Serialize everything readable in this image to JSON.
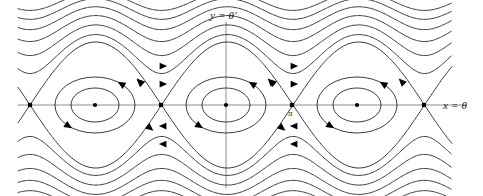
{
  "figure": {
    "title": "",
    "type": "phase-portrait",
    "background_color": "#ffffff",
    "curve_color": "#1a1a1a",
    "axis_color": "#808080",
    "labels": {
      "y_axis": {
        "text": "y = θ′",
        "lhs": "y",
        "eq": "=",
        "rhs": "θ′"
      },
      "x_axis": {
        "text": "x = θ",
        "lhs": "x",
        "eq": "=",
        "rhs": "θ"
      },
      "pi_tick": {
        "text": "π"
      }
    }
  },
  "chart_data": {
    "type": "line",
    "title": "",
    "xlabel": "x = θ",
    "ylabel": "y = θ′",
    "grid": false,
    "legend": null,
    "annotations": [
      {
        "text": "y = θ′",
        "position": "top-center",
        "px": [
          215,
          14
        ]
      },
      {
        "text": "x = θ",
        "position": "right-middle",
        "px": [
          448,
          105
        ]
      },
      {
        "text": "π",
        "position": "below-saddle",
        "px": [
          291,
          113
        ]
      }
    ],
    "axes": {
      "x_axis_y_px": 105,
      "y_axis_x_px": 226,
      "xlim_px": [
        18,
        452
      ],
      "ylim_px": [
        22,
        184
      ]
    },
    "fixed_points": {
      "saddles": [
        {
          "label": "-π",
          "px": [
            30,
            105
          ]
        },
        {
          "label": "0-left-boundary",
          "px": [
            161,
            105
          ]
        },
        {
          "label": "π",
          "px": [
            292,
            105
          ]
        },
        {
          "label": "2π",
          "px": [
            424,
            105
          ]
        }
      ],
      "centers": [
        {
          "label": "center-left",
          "px": [
            95,
            105
          ]
        },
        {
          "label": "center-middle",
          "px": [
            226,
            105
          ]
        },
        {
          "label": "center-right",
          "px": [
            357,
            105
          ]
        }
      ]
    },
    "period_px": 131.5,
    "libration_orbits": {
      "count_per_well": 2,
      "radii_px": [
        {
          "rx": 40,
          "ry": 28
        },
        {
          "rx": 24,
          "ry": 17
        }
      ],
      "direction": "clockwise"
    },
    "separatrix": {
      "amplitude_px": 62,
      "direction": "clockwise"
    },
    "rotation_orbits": {
      "above": {
        "count": 6,
        "direction": "right",
        "offsets_px": [
          10,
          22,
          33,
          43,
          52,
          60
        ]
      },
      "below": {
        "count": 6,
        "direction": "left",
        "offsets_px": [
          10,
          22,
          33,
          43,
          52,
          60
        ]
      }
    },
    "arrows": {
      "upper_rotation": [
        {
          "px": [
            163,
            66
          ],
          "dir": "right"
        },
        {
          "px": [
            163,
            84
          ],
          "dir": "right"
        },
        {
          "px": [
            294,
            66
          ],
          "dir": "right"
        },
        {
          "px": [
            294,
            84
          ],
          "dir": "right"
        }
      ],
      "lower_rotation": [
        {
          "px": [
            163,
            144
          ],
          "dir": "left"
        },
        {
          "px": [
            163,
            126
          ],
          "dir": "left"
        },
        {
          "px": [
            294,
            144
          ],
          "dir": "left"
        },
        {
          "px": [
            294,
            126
          ],
          "dir": "left"
        }
      ],
      "separatrix": [
        {
          "px": [
            140,
            82
          ],
          "dir": "up-left"
        },
        {
          "px": [
            150,
            128
          ],
          "dir": "down-right"
        },
        {
          "px": [
            272,
            82
          ],
          "dir": "up-left"
        },
        {
          "px": [
            282,
            128
          ],
          "dir": "down-right"
        }
      ],
      "libration": [
        {
          "px": [
            125,
            80
          ],
          "dir": "clockwise"
        },
        {
          "px": [
            256,
            80
          ],
          "dir": "clockwise"
        },
        {
          "px": [
            388,
            80
          ],
          "dir": "clockwise"
        }
      ]
    }
  }
}
